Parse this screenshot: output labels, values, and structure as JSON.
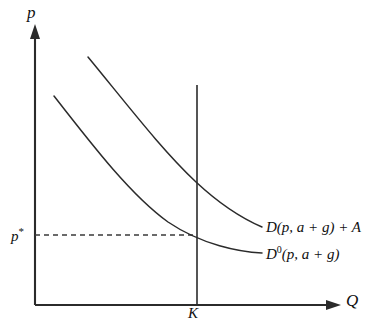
{
  "figure": {
    "type": "economics-supply-demand-diagram",
    "background_color": "#ffffff",
    "line_color": "#2b2b2b",
    "axes": {
      "vertical_label": "p",
      "horizontal_label": "Q",
      "origin": {
        "x": 35,
        "y": 305
      },
      "vertical_top": {
        "x": 35,
        "y": 28
      },
      "horizontal_right": {
        "x": 340,
        "y": 305
      }
    },
    "ticks": {
      "price_level": {
        "label_base": "p",
        "label_star": "*",
        "value_y": 235
      },
      "capacity": {
        "label": "K",
        "value_x": 197
      }
    },
    "capacity_line": {
      "name": "capacity-constraint-line",
      "x": 197,
      "y_top": 85,
      "y_bottom": 305
    },
    "guide_line": {
      "name": "price-star-dashed-guide",
      "style": "dashed",
      "from": {
        "x": 35,
        "y": 235
      },
      "to": {
        "x": 197,
        "y": 235
      }
    },
    "curves": [
      {
        "name": "demand-curve-shifted",
        "label_parts": {
          "d": "D",
          "superscript": "",
          "args": "(p, a + g) + A"
        },
        "label_text": "D(p, a + g) + A",
        "path": "M 88 57 C 130 108, 162 150, 196 182 C 226 210, 248 221, 262 227",
        "leader": {
          "x1": 245,
          "y1": 215,
          "x2": 264,
          "y2": 227
        }
      },
      {
        "name": "demand-curve-baseline",
        "label_parts": {
          "d": "D",
          "superscript": "0",
          "args": "(p, a + g)"
        },
        "label_text": "D0(p, a + g)",
        "path": "M 54 96 C 96 150, 132 196, 168 222 C 202 245, 240 252, 262 253",
        "leader": {
          "x1": 245,
          "y1": 248,
          "x2": 264,
          "y2": 253
        }
      }
    ],
    "intersections": [
      {
        "name": "baseline-demand-at-capacity",
        "x": 197,
        "y": 235
      },
      {
        "name": "shifted-demand-at-capacity",
        "x": 197,
        "y": 183
      }
    ]
  }
}
